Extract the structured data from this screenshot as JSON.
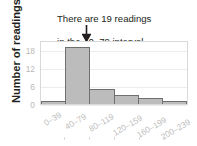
{
  "annotation": {
    "line1": "There are 19 readings",
    "line2": "in the 40–79 interval.",
    "arrow_icon": "down-arrow-icon",
    "points_to_category": "40–79"
  },
  "axes": {
    "ylabel": "Number of readings",
    "yticks": [
      "0",
      "6",
      "12",
      "18"
    ],
    "xticks": [
      "0–39",
      "40–79",
      "80–119",
      "120–159",
      "160–199",
      "200–239"
    ]
  },
  "colors": {
    "bar_fill": "#bcbcbc",
    "bar_stroke": "#6f6f6f",
    "text": "#231f20",
    "tick_text": "#bdbdbd",
    "grid": "#ececec",
    "plot_border": "#d9d9d9",
    "background": "#ffffff"
  },
  "chart_data": {
    "type": "bar",
    "title": "",
    "subtitle": "",
    "xlabel": "",
    "ylabel": "Number of readings",
    "categories": [
      "0–39",
      "40–79",
      "80–119",
      "120–159",
      "160–199",
      "200–239"
    ],
    "values": [
      1,
      19,
      5,
      3,
      2,
      1
    ],
    "ylim": [
      0,
      21
    ],
    "yticks": [
      0,
      6,
      12,
      18
    ],
    "grid": true,
    "legend": "none",
    "annotations": [
      {
        "text": "There are 19 readings in the 40–79 interval.",
        "target_category": "40–79",
        "target_value": 19,
        "arrow": "down"
      }
    ]
  }
}
